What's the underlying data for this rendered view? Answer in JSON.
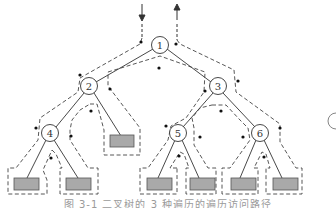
{
  "diagram": {
    "type": "binary-tree-traversal-path",
    "nodes": [
      {
        "id": "1",
        "label": "1",
        "x": 160,
        "y": 45
      },
      {
        "id": "2",
        "label": "2",
        "x": 89,
        "y": 86
      },
      {
        "id": "3",
        "label": "3",
        "x": 218,
        "y": 86
      },
      {
        "id": "4",
        "label": "4",
        "x": 50,
        "y": 133
      },
      {
        "id": "5",
        "label": "5",
        "x": 178,
        "y": 133
      },
      {
        "id": "6",
        "label": "6",
        "x": 260,
        "y": 133
      }
    ],
    "null_leaves": [
      {
        "parent": "2",
        "x": 121,
        "y": 141
      },
      {
        "parent": "4",
        "x": 27,
        "y": 183
      },
      {
        "parent": "4",
        "x": 78,
        "y": 183
      },
      {
        "parent": "5",
        "x": 158,
        "y": 183
      },
      {
        "parent": "5",
        "x": 199,
        "y": 183
      },
      {
        "parent": "6",
        "x": 240,
        "y": 183
      },
      {
        "parent": "6",
        "x": 282,
        "y": 183
      }
    ],
    "arrows": {
      "in_label": "entry",
      "out_label": "exit"
    },
    "colors": {
      "line": "#333333",
      "dashed": "#444444",
      "leaf_fill": "#a9a9a9",
      "leaf_stroke": "#555555"
    },
    "partial_node_right": "("
  },
  "caption": "图 3-1 二叉树的 3 种遍历的遍历访问路径"
}
